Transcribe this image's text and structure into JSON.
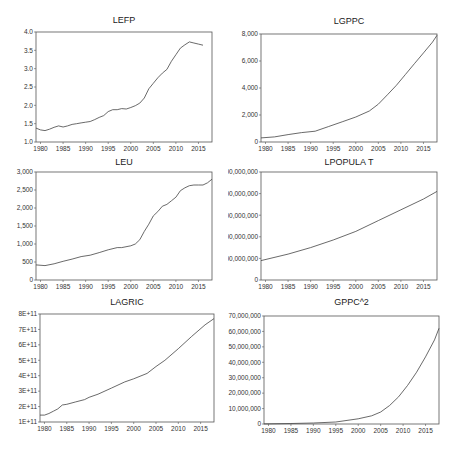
{
  "chart_data": [
    {
      "id": "lefp",
      "type": "line",
      "title": "LEFP",
      "xlabel": "",
      "ylabel": "",
      "xlim": [
        1979,
        2018
      ],
      "ylim": [
        1.0,
        4.0
      ],
      "yticks": [
        1.0,
        1.5,
        2.0,
        2.5,
        3.0,
        3.5,
        4.0
      ],
      "ytick_labels": [
        "1.0",
        "1.5",
        "2.0",
        "2.5",
        "3.0",
        "3.5",
        "4.0"
      ],
      "xticks": [
        1980,
        1985,
        1990,
        1995,
        2000,
        2005,
        2010,
        2015
      ],
      "grid": false,
      "x": [
        1979,
        1980,
        1981,
        1982,
        1983,
        1984,
        1985,
        1986,
        1987,
        1988,
        1989,
        1990,
        1991,
        1992,
        1993,
        1994,
        1995,
        1996,
        1997,
        1998,
        1999,
        2000,
        2001,
        2002,
        2003,
        2004,
        2005,
        2006,
        2007,
        2008,
        2009,
        2010,
        2011,
        2012,
        2013,
        2014,
        2015,
        2016
      ],
      "values": [
        1.38,
        1.33,
        1.31,
        1.35,
        1.4,
        1.44,
        1.41,
        1.44,
        1.48,
        1.5,
        1.52,
        1.54,
        1.56,
        1.61,
        1.67,
        1.72,
        1.83,
        1.88,
        1.88,
        1.91,
        1.9,
        1.94,
        1.99,
        2.06,
        2.2,
        2.45,
        2.6,
        2.75,
        2.88,
        2.98,
        3.2,
        3.38,
        3.56,
        3.65,
        3.73,
        3.7,
        3.67,
        3.64
      ]
    },
    {
      "id": "lgppc",
      "type": "line",
      "title": "LGPPC",
      "xlabel": "",
      "ylabel": "",
      "xlim": [
        1979,
        2018
      ],
      "ylim": [
        0,
        8000
      ],
      "yticks": [
        0,
        2000,
        4000,
        6000,
        8000
      ],
      "ytick_labels": [
        "0",
        "2,000",
        "4,000",
        "6,000",
        "8,000"
      ],
      "xticks": [
        1980,
        1985,
        1990,
        1995,
        2000,
        2005,
        2010,
        2015
      ],
      "grid": false,
      "x": [
        1979,
        1982,
        1985,
        1988,
        1991,
        1994,
        1997,
        2000,
        2003,
        2005,
        2007,
        2009,
        2011,
        2013,
        2015,
        2017,
        2018
      ],
      "values": [
        300,
        380,
        550,
        700,
        800,
        1150,
        1500,
        1850,
        2300,
        2800,
        3500,
        4200,
        5000,
        5800,
        6600,
        7400,
        7900
      ]
    },
    {
      "id": "leu",
      "type": "line",
      "title": "LEU",
      "xlabel": "",
      "ylabel": "",
      "xlim": [
        1979,
        2018
      ],
      "ylim": [
        0,
        3000
      ],
      "yticks": [
        0,
        500,
        1000,
        1500,
        2000,
        2500,
        3000
      ],
      "ytick_labels": [
        "0",
        "500",
        "1,000",
        "1,500",
        "2,000",
        "2,500",
        "3,000"
      ],
      "xticks": [
        1980,
        1985,
        1990,
        1995,
        2000,
        2005,
        2010,
        2015
      ],
      "grid": false,
      "x": [
        1979,
        1981,
        1983,
        1985,
        1987,
        1989,
        1991,
        1993,
        1995,
        1997,
        1998,
        2000,
        2001,
        2002,
        2003,
        2004,
        2005,
        2006,
        2007,
        2008,
        2009,
        2010,
        2011,
        2012,
        2013,
        2014,
        2015,
        2016,
        2017,
        2018
      ],
      "values": [
        420,
        400,
        450,
        520,
        580,
        650,
        690,
        760,
        840,
        900,
        900,
        950,
        1000,
        1120,
        1350,
        1550,
        1780,
        1900,
        2050,
        2100,
        2200,
        2300,
        2480,
        2560,
        2620,
        2640,
        2640,
        2640,
        2700,
        2800
      ]
    },
    {
      "id": "lpopulat",
      "type": "line",
      "title": "LPOPULA T",
      "xlabel": "",
      "ylabel": "",
      "xlim": [
        1979,
        2018
      ],
      "ylim": [
        0,
        1000000000
      ],
      "yticks": [
        0,
        200000000,
        400000000,
        600000000,
        800000000,
        1000000000
      ],
      "ytick_labels": [
        "0",
        "200,000,000",
        "400,000,000",
        "600,000,000",
        "800,000,000",
        "1,000,000,000"
      ],
      "xticks": [
        1980,
        1985,
        1990,
        1995,
        2000,
        2005,
        2010,
        2015
      ],
      "grid": false,
      "x": [
        1979,
        1985,
        1990,
        1995,
        2000,
        2005,
        2010,
        2015,
        2018
      ],
      "values": [
        180000000,
        240000000,
        300000000,
        370000000,
        450000000,
        550000000,
        650000000,
        750000000,
        820000000
      ]
    },
    {
      "id": "lagric",
      "type": "line",
      "title": "LAGRIC",
      "xlabel": "",
      "ylabel": "",
      "xlim": [
        1979,
        2018
      ],
      "ylim": [
        100000000000,
        800000000000
      ],
      "yticks": [
        100000000000.0,
        200000000000.0,
        300000000000.0,
        400000000000.0,
        500000000000.0,
        600000000000.0,
        700000000000.0,
        800000000000.0
      ],
      "ytick_labels": [
        "1E+11",
        "2E+11",
        "3E+11",
        "4E+11",
        "5E+11",
        "6E+11",
        "7E+11",
        "8E+11"
      ],
      "xticks": [
        1980,
        1985,
        1990,
        1995,
        2000,
        2005,
        2010,
        2015
      ],
      "grid": false,
      "x": [
        1979,
        1980,
        1981,
        1982,
        1983,
        1984,
        1985,
        1987,
        1989,
        1990,
        1992,
        1995,
        1998,
        2000,
        2003,
        2005,
        2007,
        2010,
        2013,
        2016,
        2018
      ],
      "values": [
        145000000000.0,
        145000000000.0,
        155000000000.0,
        170000000000.0,
        185000000000.0,
        210000000000.0,
        215000000000.0,
        230000000000.0,
        245000000000.0,
        260000000000.0,
        280000000000.0,
        320000000000.0,
        360000000000.0,
        380000000000.0,
        415000000000.0,
        460000000000.0,
        500000000000.0,
        575000000000.0,
        655000000000.0,
        730000000000.0,
        770000000000.0
      ]
    },
    {
      "id": "gppc2",
      "type": "line",
      "title": "GPPC^2",
      "xlabel": "",
      "ylabel": "",
      "xlim": [
        1979,
        2018
      ],
      "ylim": [
        0,
        70000000
      ],
      "yticks": [
        0,
        10000000,
        20000000,
        30000000,
        40000000,
        50000000,
        60000000,
        70000000
      ],
      "ytick_labels": [
        "0",
        "10,000,000",
        "20,000,000",
        "30,000,000",
        "40,000,000",
        "50,000,000",
        "60,000,000",
        "70,000,000"
      ],
      "xticks": [
        1980,
        1985,
        1990,
        1995,
        2000,
        2005,
        2010,
        2015
      ],
      "grid": false,
      "x": [
        1979,
        1985,
        1990,
        1995,
        2000,
        2003,
        2005,
        2007,
        2009,
        2011,
        2013,
        2015,
        2017,
        2018
      ],
      "values": [
        90000,
        300000,
        640000,
        1300000,
        3400000,
        5300000,
        7800000,
        12000000,
        17600000,
        25000000,
        33600000,
        43500000,
        54500000,
        62000000
      ]
    }
  ],
  "xtick_labels": [
    "1980",
    "1985",
    "1990",
    "1995",
    "2000",
    "2005",
    "2010",
    "2015"
  ]
}
